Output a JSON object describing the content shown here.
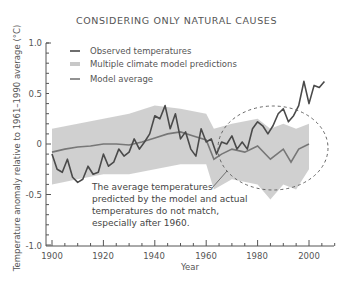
{
  "chart_data": {
    "type": "line",
    "title": "CONSIDERING ONLY NATURAL CAUSES",
    "xlabel": "Year",
    "ylabel": "Temperature anomaly relative to 1961–1990 average (°C)",
    "xlim": [
      1900,
      2010
    ],
    "ylim": [
      -1.0,
      1.0
    ],
    "x_ticks": [
      "1900",
      "1920",
      "1940",
      "1960",
      "1980",
      "2000"
    ],
    "y_ticks": [
      "1.0",
      "0.5",
      "0",
      "-0.5",
      "-1.0"
    ],
    "legend": [
      {
        "label": "Observed temperatures",
        "style": "dark line"
      },
      {
        "label": "Multiple climate model predictions",
        "style": "light grey band"
      },
      {
        "label": "Model average",
        "style": "medium grey line"
      }
    ],
    "legend_position": "upper left",
    "grid": false,
    "series": [
      {
        "name": "Observed temperatures",
        "x": [
          1900,
          1902,
          1904,
          1906,
          1908,
          1910,
          1912,
          1914,
          1916,
          1918,
          1920,
          1922,
          1924,
          1926,
          1928,
          1930,
          1932,
          1934,
          1936,
          1938,
          1940,
          1942,
          1944,
          1946,
          1948,
          1950,
          1952,
          1954,
          1956,
          1958,
          1960,
          1962,
          1964,
          1966,
          1968,
          1970,
          1972,
          1974,
          1976,
          1978,
          1980,
          1982,
          1984,
          1986,
          1988,
          1990,
          1992,
          1994,
          1996,
          1998,
          2000,
          2002,
          2004,
          2006
        ],
        "values": [
          -0.1,
          -0.25,
          -0.28,
          -0.15,
          -0.33,
          -0.38,
          -0.35,
          -0.22,
          -0.3,
          -0.28,
          -0.1,
          -0.22,
          -0.18,
          -0.05,
          -0.12,
          -0.08,
          0.05,
          -0.05,
          0.02,
          0.1,
          0.28,
          0.25,
          0.38,
          0.15,
          0.3,
          0.05,
          0.12,
          -0.05,
          -0.12,
          0.15,
          0.02,
          0.05,
          -0.1,
          0.02,
          0.0,
          0.08,
          -0.05,
          0.02,
          -0.05,
          0.15,
          0.22,
          0.18,
          0.1,
          0.18,
          0.3,
          0.35,
          0.22,
          0.28,
          0.38,
          0.62,
          0.4,
          0.58,
          0.56,
          0.62
        ]
      },
      {
        "name": "Model average",
        "x": [
          1900,
          1905,
          1910,
          1915,
          1920,
          1925,
          1930,
          1935,
          1940,
          1945,
          1950,
          1955,
          1960,
          1963,
          1966,
          1970,
          1975,
          1980,
          1985,
          1990,
          1993,
          1996,
          2000
        ],
        "values": [
          -0.08,
          -0.05,
          -0.03,
          -0.02,
          0.0,
          0.0,
          -0.01,
          0.02,
          0.06,
          0.1,
          0.12,
          0.08,
          0.04,
          -0.15,
          -0.1,
          -0.05,
          -0.08,
          -0.02,
          -0.15,
          -0.05,
          -0.18,
          -0.05,
          0.0
        ]
      },
      {
        "name": "Multiple climate model predictions",
        "x": [
          1900,
          1910,
          1920,
          1930,
          1940,
          1950,
          1960,
          1963,
          1970,
          1980,
          1985,
          1990,
          1995,
          2000
        ],
        "upper": [
          0.15,
          0.2,
          0.25,
          0.3,
          0.38,
          0.35,
          0.3,
          0.15,
          0.2,
          0.25,
          0.15,
          0.2,
          0.15,
          0.2
        ],
        "lower": [
          -0.4,
          -0.35,
          -0.3,
          -0.3,
          -0.25,
          -0.2,
          -0.2,
          -0.45,
          -0.35,
          -0.4,
          -0.55,
          -0.4,
          -0.45,
          -0.25
        ]
      }
    ],
    "annotations": [
      {
        "text": "The average temperatures predicted by the model and actual temperatures do not match, especially after 1960.",
        "target": "dashed ellipse around 1965–2008"
      }
    ]
  },
  "labels": {
    "title": "CONSIDERING ONLY NATURAL CAUSES",
    "xlabel": "Year",
    "ylabel": "Temperature anomaly relative to 1961–1990 average (°C)",
    "x_ticks": [
      "1900",
      "1920",
      "1940",
      "1960",
      "1980",
      "2000"
    ],
    "y_ticks": [
      "1.0",
      "0.5",
      "0",
      "-0.5",
      "-1.0"
    ],
    "legend": [
      "Observed temperatures",
      "Multiple climate model predictions",
      "Model average"
    ],
    "annotation_lines": [
      "The average temperatures",
      "predicted by the model and actual",
      "temperatures do not match,",
      "especially after 1960."
    ]
  }
}
